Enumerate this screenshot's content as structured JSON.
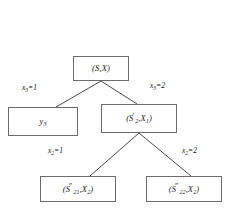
{
  "figure": {
    "type": "decision-tree-diagram",
    "background_color": "#ffffff",
    "line_color": "#4a4a4a",
    "box_border_color": "#6b6b6b",
    "text_color": "#1a1a1a",
    "caption": ""
  },
  "nodes": {
    "root": {
      "id": "root",
      "label_plain": "(S,X)",
      "label_parts": {
        "open": "(",
        "s": "S",
        "comma": ",",
        "x": "X",
        "close": ")"
      }
    },
    "leaf_y3": {
      "id": "leaf-y3",
      "label_plain": "y3",
      "label_parts": {
        "base": "y",
        "sub": "3"
      }
    },
    "internal_s2": {
      "id": "internal-s2-x1",
      "label_plain": "(S'2,X1)",
      "label_parts": {
        "open": "(",
        "s": "S",
        "s_prime": "′",
        "s_sub": "2",
        "comma": ",",
        "x": "X",
        "x_sub": "1",
        "close": ")"
      }
    },
    "leaf_s21": {
      "id": "leaf-s21-x2",
      "label_plain": "(S″ 21,X2)",
      "label_parts": {
        "open": "(",
        "s": "S",
        "s_prime": "″",
        "s_sub": "21",
        "comma": ",",
        "x": "X",
        "x_sub": "2",
        "close": ")"
      }
    },
    "leaf_s22": {
      "id": "leaf-s22-x2",
      "label_plain": "(S″ 22,X2)",
      "label_parts": {
        "open": "(",
        "s": "S",
        "s_prime": "″",
        "s_sub": "22",
        "comma": ",",
        "x": "X",
        "x_sub": "2",
        "close": ")"
      }
    }
  },
  "edges": [
    {
      "id": "root-to-y3",
      "from": "root",
      "to": "leaf_y3",
      "label_plain": "x3=1",
      "label_parts": {
        "var": "x",
        "sub": "3",
        "eq": "=1"
      }
    },
    {
      "id": "root-to-internal",
      "from": "root",
      "to": "internal_s2",
      "label_plain": "x3=2",
      "label_parts": {
        "var": "x",
        "sub": "3",
        "eq": "=2"
      }
    },
    {
      "id": "internal-to-s21",
      "from": "internal_s2",
      "to": "leaf_s21",
      "label_plain": "x2=1",
      "label_parts": {
        "var": "x",
        "sub": "2",
        "eq": "=1"
      }
    },
    {
      "id": "internal-to-s22",
      "from": "internal_s2",
      "to": "leaf_s22",
      "label_plain": "x2=2",
      "label_parts": {
        "var": "x",
        "sub": "2",
        "eq": "=2"
      }
    }
  ]
}
